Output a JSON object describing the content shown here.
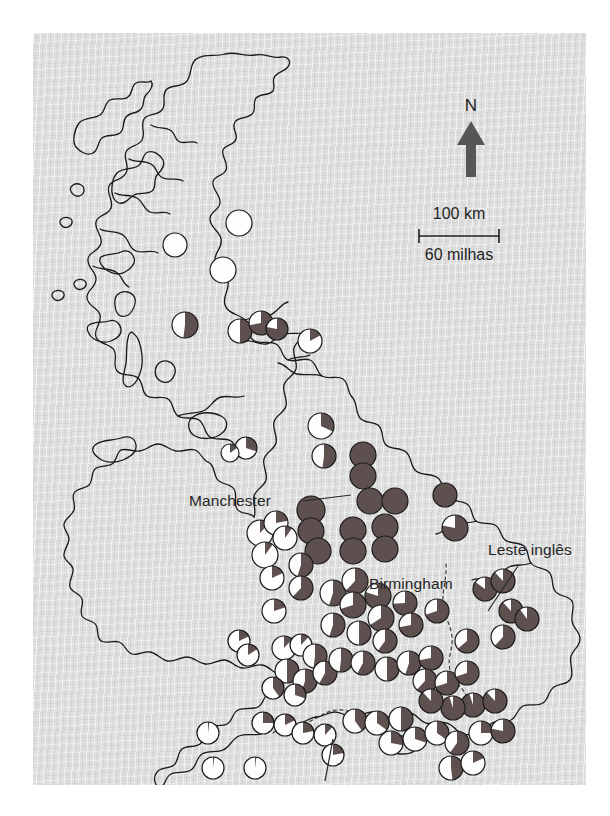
{
  "figure": {
    "type": "map",
    "region": "Great Britain",
    "panel": {
      "x": 33,
      "y": 33,
      "width": 553,
      "height": 752,
      "background_color": "#dedede"
    },
    "page_background": "#ffffff"
  },
  "colors": {
    "dark_wedge": "#5f5050",
    "light_wedge": "#fdfdfd",
    "pie_outline": "#1a1a1a",
    "coastline": "#1a1a1a",
    "county_dashed": "#3a3a3a",
    "text": "#262626",
    "arrow": "#565656"
  },
  "north_arrow": {
    "label": "N",
    "name": "north-arrow",
    "x": 438,
    "y": 90
  },
  "scale_bar": {
    "top_label": "100 km",
    "bottom_label": "60 milhas",
    "bar_left": 386,
    "bar_right": 466,
    "bar_y": 230
  },
  "place_labels": [
    {
      "text": "Manchester",
      "x": 156,
      "y": 473,
      "anchor": "start",
      "leader": {
        "x1": 270,
        "y1": 468,
        "x2": 318,
        "y2": 462
      }
    },
    {
      "text": "Birmingham",
      "x": 336,
      "y": 556,
      "anchor": "start",
      "leader": null
    },
    {
      "text": "Leste inglês",
      "x": 455,
      "y": 522,
      "anchor": "start",
      "leader": {
        "x1": 485,
        "y1": 533,
        "x2": 455,
        "y2": 578
      }
    },
    {
      "text": "Dorset",
      "x": 282,
      "y": 764,
      "anchor": "start",
      "leader": {
        "x1": 292,
        "y1": 748,
        "x2": 300,
        "y2": 706
      }
    }
  ],
  "legend_note": "Each circle is a two-category pie chart; the dark wedge fraction increases from north-west (mostly light) to south-east (mostly dark).",
  "chart_data": {
    "type": "pie",
    "categories": [
      "dark",
      "light"
    ],
    "unit": "fraction",
    "points": [
      {
        "x": 206,
        "y": 190,
        "r": 13,
        "dark": 0.0
      },
      {
        "x": 190,
        "y": 237,
        "r": 13,
        "dark": 0.0
      },
      {
        "x": 142,
        "y": 212,
        "r": 12,
        "dark": 0.0
      },
      {
        "x": 152,
        "y": 292,
        "r": 13,
        "dark": 0.52
      },
      {
        "x": 207,
        "y": 298,
        "r": 12,
        "dark": 0.5
      },
      {
        "x": 228,
        "y": 290,
        "r": 12,
        "dark": 0.72
      },
      {
        "x": 244,
        "y": 296,
        "r": 11,
        "dark": 0.78
      },
      {
        "x": 277,
        "y": 308,
        "r": 12,
        "dark": 0.17
      },
      {
        "x": 288,
        "y": 393,
        "r": 13,
        "dark": 0.32
      },
      {
        "x": 213,
        "y": 415,
        "r": 11,
        "dark": 0.3
      },
      {
        "x": 197,
        "y": 420,
        "r": 9,
        "dark": 0.15
      },
      {
        "x": 291,
        "y": 423,
        "r": 12,
        "dark": 0.52
      },
      {
        "x": 330,
        "y": 422,
        "r": 13,
        "dark": 1.0
      },
      {
        "x": 330,
        "y": 443,
        "r": 13,
        "dark": 1.0
      },
      {
        "x": 337,
        "y": 468,
        "r": 13,
        "dark": 1.0
      },
      {
        "x": 362,
        "y": 468,
        "r": 13,
        "dark": 1.0
      },
      {
        "x": 278,
        "y": 477,
        "r": 14,
        "dark": 1.0
      },
      {
        "x": 278,
        "y": 498,
        "r": 13,
        "dark": 1.0
      },
      {
        "x": 285,
        "y": 518,
        "r": 13,
        "dark": 1.0
      },
      {
        "x": 320,
        "y": 497,
        "r": 13,
        "dark": 1.0
      },
      {
        "x": 320,
        "y": 518,
        "r": 13,
        "dark": 1.0
      },
      {
        "x": 352,
        "y": 494,
        "r": 13,
        "dark": 1.0
      },
      {
        "x": 352,
        "y": 516,
        "r": 13,
        "dark": 1.0
      },
      {
        "x": 412,
        "y": 462,
        "r": 12,
        "dark": 1.0
      },
      {
        "x": 422,
        "y": 495,
        "r": 13,
        "dark": 0.78
      },
      {
        "x": 227,
        "y": 500,
        "r": 13,
        "dark": 0.12
      },
      {
        "x": 243,
        "y": 490,
        "r": 12,
        "dark": 0.22
      },
      {
        "x": 252,
        "y": 505,
        "r": 12,
        "dark": 0.1
      },
      {
        "x": 232,
        "y": 522,
        "r": 13,
        "dark": 0.1
      },
      {
        "x": 239,
        "y": 545,
        "r": 12,
        "dark": 0.18
      },
      {
        "x": 241,
        "y": 578,
        "r": 12,
        "dark": 0.2
      },
      {
        "x": 268,
        "y": 532,
        "r": 12,
        "dark": 0.55
      },
      {
        "x": 268,
        "y": 555,
        "r": 12,
        "dark": 0.62
      },
      {
        "x": 300,
        "y": 560,
        "r": 13,
        "dark": 0.55
      },
      {
        "x": 322,
        "y": 548,
        "r": 13,
        "dark": 0.62
      },
      {
        "x": 320,
        "y": 572,
        "r": 13,
        "dark": 0.7
      },
      {
        "x": 345,
        "y": 563,
        "r": 13,
        "dark": 0.8
      },
      {
        "x": 348,
        "y": 585,
        "r": 13,
        "dark": 0.66
      },
      {
        "x": 372,
        "y": 570,
        "r": 12,
        "dark": 0.74
      },
      {
        "x": 378,
        "y": 592,
        "r": 12,
        "dark": 0.72
      },
      {
        "x": 404,
        "y": 578,
        "r": 12,
        "dark": 0.7
      },
      {
        "x": 300,
        "y": 592,
        "r": 12,
        "dark": 0.55
      },
      {
        "x": 326,
        "y": 600,
        "r": 12,
        "dark": 0.5
      },
      {
        "x": 352,
        "y": 608,
        "r": 12,
        "dark": 0.6
      },
      {
        "x": 206,
        "y": 608,
        "r": 11,
        "dark": 0.18
      },
      {
        "x": 215,
        "y": 622,
        "r": 11,
        "dark": 0.16
      },
      {
        "x": 251,
        "y": 615,
        "r": 12,
        "dark": 0.12
      },
      {
        "x": 268,
        "y": 612,
        "r": 11,
        "dark": 0.12
      },
      {
        "x": 282,
        "y": 623,
        "r": 12,
        "dark": 0.52
      },
      {
        "x": 254,
        "y": 638,
        "r": 12,
        "dark": 0.5
      },
      {
        "x": 272,
        "y": 648,
        "r": 12,
        "dark": 0.55
      },
      {
        "x": 292,
        "y": 640,
        "r": 12,
        "dark": 0.58
      },
      {
        "x": 308,
        "y": 627,
        "r": 12,
        "dark": 0.52
      },
      {
        "x": 330,
        "y": 630,
        "r": 12,
        "dark": 0.58
      },
      {
        "x": 240,
        "y": 655,
        "r": 11,
        "dark": 0.4
      },
      {
        "x": 262,
        "y": 662,
        "r": 11,
        "dark": 0.3
      },
      {
        "x": 354,
        "y": 636,
        "r": 12,
        "dark": 0.5
      },
      {
        "x": 376,
        "y": 630,
        "r": 12,
        "dark": 0.55
      },
      {
        "x": 398,
        "y": 625,
        "r": 12,
        "dark": 0.72
      },
      {
        "x": 392,
        "y": 648,
        "r": 12,
        "dark": 0.62
      },
      {
        "x": 414,
        "y": 650,
        "r": 12,
        "dark": 0.7
      },
      {
        "x": 434,
        "y": 608,
        "r": 12,
        "dark": 0.64
      },
      {
        "x": 434,
        "y": 640,
        "r": 12,
        "dark": 0.7
      },
      {
        "x": 452,
        "y": 556,
        "r": 12,
        "dark": 0.85
      },
      {
        "x": 470,
        "y": 548,
        "r": 12,
        "dark": 0.88
      },
      {
        "x": 478,
        "y": 578,
        "r": 12,
        "dark": 0.88
      },
      {
        "x": 494,
        "y": 586,
        "r": 12,
        "dark": 0.9
      },
      {
        "x": 470,
        "y": 604,
        "r": 12,
        "dark": 0.62
      },
      {
        "x": 440,
        "y": 672,
        "r": 12,
        "dark": 0.95
      },
      {
        "x": 462,
        "y": 668,
        "r": 12,
        "dark": 0.88
      },
      {
        "x": 420,
        "y": 675,
        "r": 12,
        "dark": 0.95
      },
      {
        "x": 398,
        "y": 668,
        "r": 12,
        "dark": 0.88
      },
      {
        "x": 230,
        "y": 690,
        "r": 11,
        "dark": 0.25
      },
      {
        "x": 252,
        "y": 692,
        "r": 11,
        "dark": 0.18
      },
      {
        "x": 270,
        "y": 700,
        "r": 11,
        "dark": 0.22
      },
      {
        "x": 292,
        "y": 702,
        "r": 11,
        "dark": 0.12
      },
      {
        "x": 300,
        "y": 722,
        "r": 11,
        "dark": 0.22
      },
      {
        "x": 175,
        "y": 700,
        "r": 11,
        "dark": 0.02
      },
      {
        "x": 180,
        "y": 735,
        "r": 11,
        "dark": 0.02
      },
      {
        "x": 222,
        "y": 735,
        "r": 11,
        "dark": 0.02
      },
      {
        "x": 322,
        "y": 688,
        "r": 12,
        "dark": 0.4
      },
      {
        "x": 344,
        "y": 690,
        "r": 12,
        "dark": 0.35
      },
      {
        "x": 368,
        "y": 686,
        "r": 12,
        "dark": 0.5
      },
      {
        "x": 358,
        "y": 710,
        "r": 12,
        "dark": 0.28
      },
      {
        "x": 382,
        "y": 706,
        "r": 12,
        "dark": 0.3
      },
      {
        "x": 404,
        "y": 700,
        "r": 12,
        "dark": 0.35
      },
      {
        "x": 424,
        "y": 710,
        "r": 12,
        "dark": 0.6
      },
      {
        "x": 448,
        "y": 700,
        "r": 12,
        "dark": 0.25
      },
      {
        "x": 470,
        "y": 698,
        "r": 12,
        "dark": 0.78
      },
      {
        "x": 418,
        "y": 735,
        "r": 12,
        "dark": 0.48
      },
      {
        "x": 440,
        "y": 730,
        "r": 12,
        "dark": 0.18
      }
    ]
  }
}
